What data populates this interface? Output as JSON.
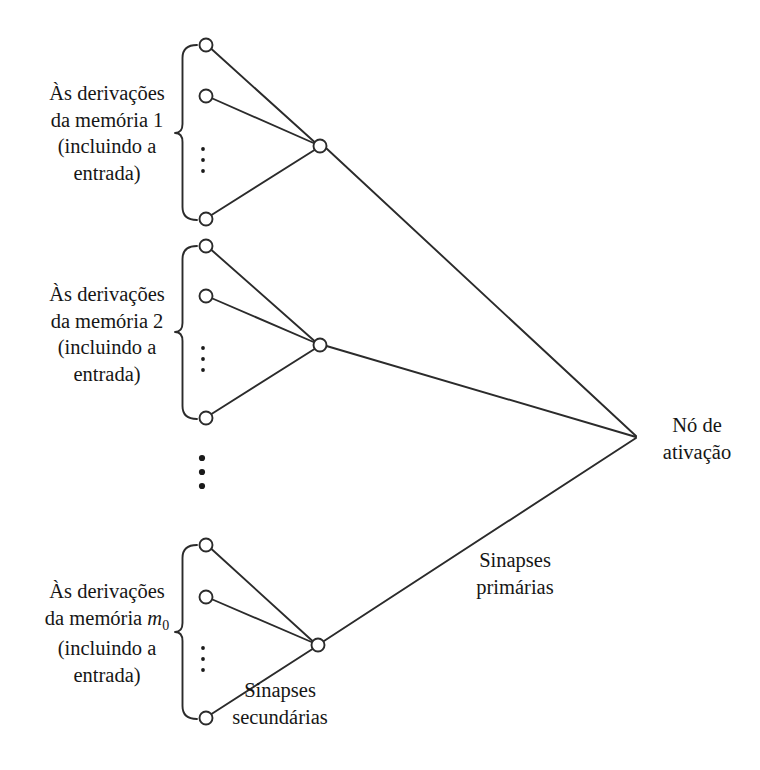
{
  "figure": {
    "background_color": "#ffffff",
    "line_color": "#2b2b2b",
    "text_color": "#161616",
    "node_fill": "#ffffff"
  },
  "labels": {
    "group_1": "Às derivações\nda memória 1\n(incluindo a\nentrada)",
    "group_2": "Às derivações\nda memória 2\n(incluindo a\nentrada)",
    "group_3_line1": "Às derivações",
    "group_3_line2a": "da memória ",
    "group_3_memory_symbol": "m",
    "group_3_memory_subscript": "0",
    "group_3_line3": "(incluindo a",
    "group_3_line4": "entrada)",
    "activation_node": "Nó de\nativação",
    "primary_synapses": "Sinapses\nprimárias",
    "secondary_synapses": "Sinapses\nsecundárias"
  },
  "structure": {
    "group_count_visible": 3,
    "memory_indices": [
      "1",
      "2",
      "m0"
    ],
    "nodes_per_group_visible": 3,
    "ellipsis_within_group": "vertical-dots",
    "ellipsis_between_groups": "vertical-dots",
    "activation_node_label": "Nó de ativação"
  },
  "geometry": {
    "activation_node": {
      "x": 637,
      "y": 437
    },
    "groups": [
      {
        "id": "group-1",
        "hub": {
          "x": 320,
          "y": 146
        },
        "inputs": [
          {
            "x": 206,
            "y": 45
          },
          {
            "x": 206,
            "y": 96
          },
          {
            "x": 206,
            "y": 219
          }
        ],
        "brace": {
          "x": 180,
          "top": 45,
          "bottom": 220
        },
        "dots": {
          "x": 203,
          "y": 160
        }
      },
      {
        "id": "group-2",
        "hub": {
          "x": 320,
          "y": 345
        },
        "inputs": [
          {
            "x": 206,
            "y": 246
          },
          {
            "x": 206,
            "y": 296
          },
          {
            "x": 206,
            "y": 418
          }
        ],
        "brace": {
          "x": 180,
          "top": 246,
          "bottom": 419
        },
        "dots": {
          "x": 203,
          "y": 359
        }
      },
      {
        "id": "group-3",
        "hub": {
          "x": 318,
          "y": 645
        },
        "inputs": [
          {
            "x": 206,
            "y": 545
          },
          {
            "x": 206,
            "y": 597
          },
          {
            "x": 206,
            "y": 718
          }
        ],
        "brace": {
          "x": 180,
          "top": 545,
          "bottom": 719
        },
        "dots": {
          "x": 203,
          "y": 659
        }
      }
    ],
    "between_group_dots": {
      "x": 202,
      "y": 472
    },
    "node_radius": 6.5
  }
}
